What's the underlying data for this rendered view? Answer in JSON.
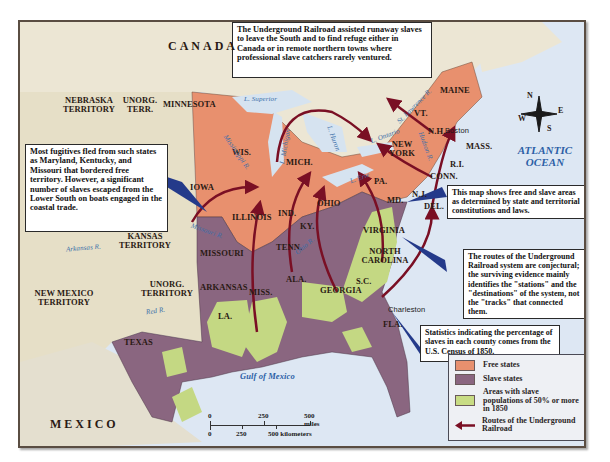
{
  "map": {
    "title_note": "The Underground Railroad assisted runaway slaves to leave the South and to find refuge either in Canada or in remote northern towns where professional slave catchers rarely ventured.",
    "notes": {
      "fugitives": "Most fugitives fled from such states as Maryland, Kentucky, and Missouri that bordered free territory. However, a significant number of slaves escaped from the Lower South on boats engaged in the coastal trade.",
      "free_slave": "This map shows free and slave areas as determined by state and territorial constitutions and laws.",
      "routes": "The routes of the Underground Railroad system are conjectural; the surviving evidence mainly identifies the \"stations\" and the \"destinations\" of the system, not the \"tracks\" that connected them.",
      "statistics": "Statistics indicating the percentage of slaves in each county comes from the U.S. Census of 1850."
    },
    "regions": {
      "canada": "CANADA",
      "mexico": "MEXICO",
      "nebraska": "NEBRASKA TERRITORY",
      "unorg_terr": "UNORG. TERR.",
      "kansas": "KANSAS TERRITORY",
      "unorg_territory": "UNORG. TERRITORY",
      "new_mexico": "NEW MEXICO TERRITORY"
    },
    "states": {
      "minnesota": "MINNESOTA",
      "wis": "WIS.",
      "iowa": "IOWA",
      "illinois": "ILLINOIS",
      "ind": "IND.",
      "mich": "MICH.",
      "ohio": "OHIO",
      "pa": "PA.",
      "new_york": "NEW YORK",
      "vt": "VT.",
      "nh": "N.H.",
      "maine": "MAINE",
      "mass": "MASS.",
      "ri": "R.I.",
      "conn": "CONN.",
      "nj": "N.J.",
      "del": "DEL.",
      "md": "MD.",
      "virginia": "VIRGINIA",
      "north_carolina": "NORTH CAROLINA",
      "sc": "S.C.",
      "georgia": "GEORGIA",
      "fla": "FLA.",
      "ala": "ALA.",
      "miss": "MISS.",
      "la": "LA.",
      "tenn": "TENN.",
      "ky": "KY.",
      "missouri": "MISSOURI",
      "arkansas": "ARKANSAS",
      "texas": "TEXAS"
    },
    "water": {
      "atlantic": "ATLANTIC OCEAN",
      "gulf": "Gulf of Mexico",
      "superior": "L. Superior",
      "michigan": "L. Michigan",
      "huron": "L. Huron",
      "erie": "L. Erie",
      "ontario": "L. Ontario",
      "st_lawrence": "St. Lawrence R.",
      "hudson": "Hudson R.",
      "mississippi": "Mississippi R.",
      "missouri_r": "Missouri R.",
      "ohio_r": "Ohio R.",
      "arkansas_r": "Arkansas R.",
      "red_r": "Red R."
    },
    "cities": {
      "boston": "Boston",
      "charleston": "Charleston"
    },
    "compass": {
      "n": "N",
      "e": "E",
      "s": "S",
      "w": "W"
    },
    "scale": {
      "miles_0": "0",
      "miles_250": "250",
      "miles_500": "500 miles",
      "km_0": "0",
      "km_250": "250",
      "km_500": "500 kilometers"
    },
    "legend": {
      "items": [
        {
          "label": "Free states",
          "color": "#e8906e"
        },
        {
          "label": "Slave states",
          "color": "#8a6680"
        },
        {
          "label": "Areas with slave populations of 50% or more in 1850",
          "color": "#c8dc84"
        },
        {
          "label": "Routes of the Underground Railroad",
          "color": "#7a0f24"
        }
      ]
    },
    "colors": {
      "free": "#e8906e",
      "slave": "#8a6680",
      "majority": "#c4d883",
      "route": "#7a0f24",
      "ocean": "#dde7f3",
      "land": "#e9e3cf",
      "callout": "#243a8a"
    }
  }
}
